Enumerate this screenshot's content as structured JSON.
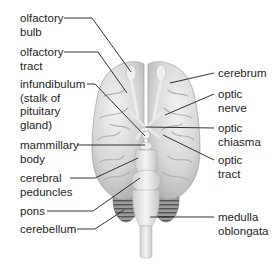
{
  "diagram": {
    "colors": {
      "background": "#ffffff",
      "brain_fill": "#d9d9d9",
      "brain_shade": "#b5b5b5",
      "brain_highlight": "#f0f0f0",
      "cerebellum": "#8a8a8a",
      "leader_line": "#1e1e1e",
      "text": "#1e1e1e"
    },
    "labels_left": [
      {
        "id": "olfactory-bulb",
        "lines": [
          "olfactory",
          "bulb"
        ],
        "text_xy": [
          20,
          12
        ],
        "line_points": [
          [
            64,
            18
          ],
          [
            92,
            18
          ],
          [
            131,
            72
          ]
        ]
      },
      {
        "id": "olfactory-tract",
        "lines": [
          "olfactory",
          "tract"
        ],
        "text_xy": [
          20,
          46
        ],
        "line_points": [
          [
            64,
            52
          ],
          [
            98,
            52
          ],
          [
            127,
            93
          ]
        ]
      },
      {
        "id": "infundibulum",
        "lines": [
          "infundibulum",
          "(stalk of",
          "pituitary",
          "gland)"
        ],
        "text_xy": [
          20,
          78
        ],
        "line_points": [
          [
            87,
            84
          ],
          [
            95,
            84
          ],
          [
            145,
            136
          ]
        ]
      },
      {
        "id": "mammillary-body",
        "lines": [
          "mammillary",
          "body"
        ],
        "text_xy": [
          20,
          139
        ],
        "line_points": [
          [
            77,
            145
          ],
          [
            145,
            145
          ]
        ]
      },
      {
        "id": "cerebral-peduncles",
        "lines": [
          "cerebral",
          "peduncles"
        ],
        "text_xy": [
          20,
          172
        ],
        "line_points": [
          [
            70,
            178
          ],
          [
            95,
            178
          ],
          [
            138,
            158
          ]
        ]
      },
      {
        "id": "pons",
        "lines": [
          "pons"
        ],
        "text_xy": [
          20,
          205
        ],
        "line_points": [
          [
            47,
            211
          ],
          [
            93,
            211
          ],
          [
            140,
            178
          ]
        ]
      },
      {
        "id": "cerebellum",
        "lines": [
          "cerebellum"
        ],
        "text_xy": [
          20,
          223
        ],
        "line_points": [
          [
            77,
            229
          ],
          [
            95,
            229
          ],
          [
            124,
            210
          ]
        ]
      }
    ],
    "labels_right": [
      {
        "id": "cerebrum",
        "lines": [
          "cerebrum"
        ],
        "text_xy": [
          218,
          67
        ],
        "line_points": [
          [
            214,
            73
          ],
          [
            170,
            83
          ]
        ]
      },
      {
        "id": "optic-nerve",
        "lines": [
          "optic",
          "nerve"
        ],
        "text_xy": [
          218,
          88
        ],
        "line_points": [
          [
            214,
            94
          ],
          [
            165,
            115
          ]
        ]
      },
      {
        "id": "optic-chiasma",
        "lines": [
          "optic",
          "chiasma"
        ],
        "text_xy": [
          218,
          122
        ],
        "line_points": [
          [
            214,
            128
          ],
          [
            145,
            127
          ]
        ]
      },
      {
        "id": "optic-tract",
        "lines": [
          "optic",
          "tract"
        ],
        "text_xy": [
          218,
          154
        ],
        "line_points": [
          [
            214,
            160
          ],
          [
            163,
            135
          ]
        ]
      },
      {
        "id": "medulla-oblongata",
        "lines": [
          "medulla",
          "oblongata"
        ],
        "text_xy": [
          218,
          211
        ],
        "line_points": [
          [
            214,
            217
          ],
          [
            150,
            217
          ]
        ]
      }
    ]
  }
}
